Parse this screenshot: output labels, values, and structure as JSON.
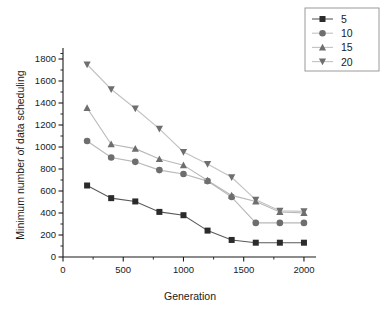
{
  "chart_data": {
    "type": "line",
    "title": "",
    "xlabel": "Generation",
    "ylabel": "Minimum number of data scheduling",
    "xlim": [
      0,
      2100
    ],
    "ylim": [
      0,
      1900
    ],
    "xticks": [
      0,
      500,
      1000,
      1500,
      2000
    ],
    "yticks": [
      0,
      200,
      400,
      600,
      800,
      1000,
      1200,
      1400,
      1600,
      1800
    ],
    "xticklabels": [
      "0",
      "500",
      "1000",
      "1500",
      "2000"
    ],
    "yticklabels": [
      "0",
      "200",
      "400",
      "600",
      "800",
      "1000",
      "1200",
      "1400",
      "1600",
      "1800"
    ],
    "grid": false,
    "legend_position": "top-right",
    "x": [
      200,
      400,
      600,
      800,
      1000,
      1200,
      1400,
      1600,
      1800,
      2000
    ],
    "series": [
      {
        "name": "5",
        "marker": "square",
        "color": "#2b2b2b",
        "line_color": "#5a5a5a",
        "values": [
          650,
          535,
          505,
          410,
          380,
          240,
          155,
          130,
          130,
          130
        ]
      },
      {
        "name": "10",
        "marker": "circle",
        "color": "#6e6e6e",
        "line_color": "#b8b8b8",
        "values": [
          1055,
          905,
          865,
          790,
          755,
          690,
          545,
          310,
          310,
          310
        ]
      },
      {
        "name": "15",
        "marker": "triangle-up",
        "color": "#6e6e6e",
        "line_color": "#b8b8b8",
        "values": [
          1355,
          1025,
          985,
          890,
          835,
          695,
          560,
          505,
          410,
          400
        ]
      },
      {
        "name": "20",
        "marker": "triangle-down",
        "color": "#6e6e6e",
        "line_color": "#c2c2c2",
        "values": [
          1750,
          1525,
          1350,
          1165,
          955,
          845,
          725,
          520,
          420,
          415
        ]
      }
    ],
    "legend": [
      {
        "label": "5",
        "marker": "square"
      },
      {
        "label": "10",
        "marker": "circle"
      },
      {
        "label": "15",
        "marker": "triangle-up"
      },
      {
        "label": "20",
        "marker": "triangle-down"
      }
    ]
  }
}
